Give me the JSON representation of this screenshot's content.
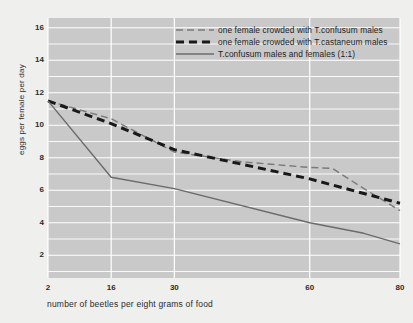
{
  "chart_data": {
    "type": "line",
    "title": "",
    "xlabel": "number of beetles per eight grams of food",
    "ylabel": "eggs per female per day",
    "xticks": [
      2,
      16,
      30,
      60,
      80
    ],
    "xtick_labels": [
      "2",
      "16",
      "30",
      "60",
      "80"
    ],
    "yticks": [
      2,
      4,
      6,
      8,
      10,
      12,
      14,
      16
    ],
    "ytick_labels": [
      "2",
      "4",
      "6",
      "8",
      "10",
      "12",
      "14",
      "16"
    ],
    "xlim": [
      2,
      80
    ],
    "ylim": [
      0.6,
      16.6
    ],
    "grid": true,
    "grid_color": "#ffffff",
    "plot_bg": "#c9c9c9",
    "page_bg": "#efefed",
    "legend_position": "top-right",
    "series": [
      {
        "name": "one female crowded with T.confusum males",
        "style": "dashed",
        "color": "#7a7a7a",
        "linewidth": 1.4,
        "dash": "7,4",
        "points": [
          {
            "x": 2,
            "y": 11.5
          },
          {
            "x": 16,
            "y": 10.4
          },
          {
            "x": 30,
            "y": 8.35
          },
          {
            "x": 45,
            "y": 7.75
          },
          {
            "x": 60,
            "y": 7.4
          },
          {
            "x": 65,
            "y": 7.35
          },
          {
            "x": 72,
            "y": 6.1
          },
          {
            "x": 80,
            "y": 4.75
          }
        ]
      },
      {
        "name": "one female crowded with T.castaneum males",
        "style": "dashed-heavy",
        "color": "#191919",
        "linewidth": 3.0,
        "dash": "8,5",
        "points": [
          {
            "x": 2,
            "y": 11.5
          },
          {
            "x": 16,
            "y": 10.1
          },
          {
            "x": 30,
            "y": 8.5
          },
          {
            "x": 45,
            "y": 7.6
          },
          {
            "x": 60,
            "y": 6.7
          },
          {
            "x": 72,
            "y": 5.8
          },
          {
            "x": 80,
            "y": 5.2
          }
        ]
      },
      {
        "name": "T.confusum males and females  (1:1)",
        "style": "solid",
        "color": "#6b6b6b",
        "linewidth": 1.4,
        "dash": "none",
        "points": [
          {
            "x": 2,
            "y": 11.5
          },
          {
            "x": 16,
            "y": 6.8
          },
          {
            "x": 30,
            "y": 6.1
          },
          {
            "x": 60,
            "y": 4.0
          },
          {
            "x": 72,
            "y": 3.35
          },
          {
            "x": 80,
            "y": 2.7
          }
        ]
      }
    ],
    "legend_entries": [
      {
        "label": "one female crowded with T.confusum males",
        "style": "dashed",
        "color": "#7a7a7a"
      },
      {
        "label": "one female crowded with T.castaneum males",
        "style": "dashed-heavy",
        "color": "#191919"
      },
      {
        "label": "T.confusum males and females  (1:1)",
        "style": "solid",
        "color": "#6b6b6b"
      }
    ]
  }
}
